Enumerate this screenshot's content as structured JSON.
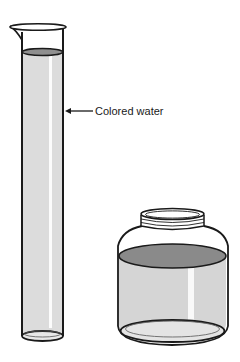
{
  "figure": {
    "type": "illustration",
    "objects": [
      {
        "name": "graduated-cylinder",
        "contents": "colored water"
      },
      {
        "name": "jar",
        "contents": "colored water"
      }
    ],
    "annotations": [
      {
        "text": "Colored water",
        "points_to": "graduated-cylinder"
      }
    ],
    "colors": {
      "ink": "#1a1a1a",
      "liquid": "#d9d9d9",
      "liquid_surface": "#8c8c8c",
      "glass_highlight": "#ffffff",
      "background": "#ffffff"
    }
  }
}
